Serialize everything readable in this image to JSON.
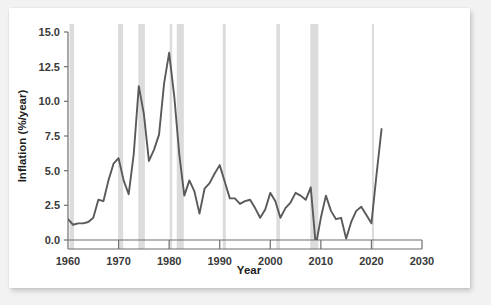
{
  "figure": {
    "background_color": "#ffffff",
    "page_background_color": "#f2f2f2",
    "line_color": "#5a5a5a",
    "recession_band_color": "#dcdcdc",
    "axis_color": "#6e6e6e",
    "text_color": "#1d1d1d"
  },
  "chart_data": {
    "type": "line",
    "title": "",
    "xlabel": "Year",
    "ylabel": "Inflation (%/year)",
    "xlim": [
      1960,
      2030
    ],
    "ylim": [
      0.0,
      15.0
    ],
    "xticks": [
      1960,
      1970,
      1980,
      1990,
      2000,
      2010,
      2020,
      2030
    ],
    "xtick_labels": [
      "1960",
      "1970",
      "1980",
      "1990",
      "2000",
      "2010",
      "2020",
      "2030"
    ],
    "yticks": [
      0.0,
      2.5,
      5.0,
      7.5,
      10.0,
      12.5,
      15.0
    ],
    "ytick_labels": [
      "0.0",
      "2.5",
      "5.0",
      "7.5",
      "10.0",
      "12.5",
      "15.0"
    ],
    "grid": false,
    "legend": null,
    "series": [
      {
        "name": "Inflation (%/year)",
        "x": [
          1960,
          1961,
          1962,
          1963,
          1964,
          1965,
          1966,
          1967,
          1968,
          1969,
          1970,
          1971,
          1972,
          1973,
          1974,
          1975,
          1976,
          1977,
          1978,
          1979,
          1980,
          1981,
          1982,
          1983,
          1984,
          1985,
          1986,
          1987,
          1988,
          1989,
          1990,
          1991,
          1992,
          1993,
          1994,
          1995,
          1996,
          1997,
          1998,
          1999,
          2000,
          2001,
          2002,
          2003,
          2004,
          2005,
          2006,
          2007,
          2008,
          2009,
          2010,
          2011,
          2012,
          2013,
          2014,
          2015,
          2016,
          2017,
          2018,
          2019,
          2020,
          2021,
          2022
        ],
        "values": [
          1.5,
          1.1,
          1.2,
          1.2,
          1.3,
          1.6,
          2.9,
          2.8,
          4.3,
          5.5,
          5.9,
          4.3,
          3.3,
          6.2,
          11.1,
          9.1,
          5.7,
          6.5,
          7.6,
          11.3,
          13.5,
          10.4,
          6.2,
          3.2,
          4.3,
          3.5,
          1.9,
          3.7,
          4.1,
          4.8,
          5.4,
          4.2,
          3.0,
          3.0,
          2.6,
          2.8,
          2.9,
          2.3,
          1.6,
          2.2,
          3.4,
          2.8,
          1.6,
          2.3,
          2.7,
          3.4,
          3.2,
          2.9,
          3.8,
          -0.4,
          1.6,
          3.2,
          2.1,
          1.5,
          1.6,
          0.1,
          1.3,
          2.1,
          2.4,
          1.8,
          1.2,
          4.7,
          8.0
        ]
      }
    ],
    "recession_bands": [
      {
        "start": 1960.3,
        "end": 1961.2
      },
      {
        "start": 1969.9,
        "end": 1970.9
      },
      {
        "start": 1973.9,
        "end": 1975.2
      },
      {
        "start": 1980.1,
        "end": 1980.6
      },
      {
        "start": 1981.5,
        "end": 1982.9
      },
      {
        "start": 1990.6,
        "end": 1991.2
      },
      {
        "start": 2001.2,
        "end": 2001.9
      },
      {
        "start": 2007.9,
        "end": 2009.5
      },
      {
        "start": 2020.1,
        "end": 2020.5
      }
    ]
  }
}
